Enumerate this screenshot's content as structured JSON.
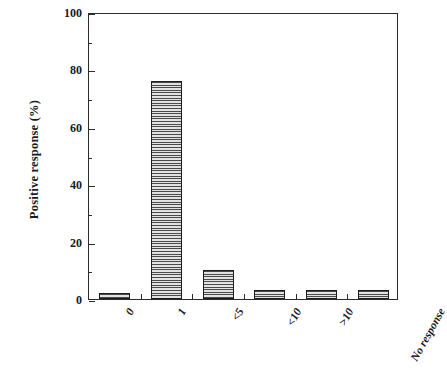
{
  "chart_data": {
    "type": "bar",
    "title": "",
    "subtitle": "",
    "xlabel": "",
    "ylabel": "Positive response (%)",
    "categories": [
      "0",
      "1",
      "<5",
      "<10",
      ">10",
      "No response"
    ],
    "values": [
      2,
      76,
      10,
      3,
      3,
      3
    ],
    "series": [
      {
        "name": "Positive response",
        "values": [
          2,
          76,
          10,
          3,
          3,
          3
        ]
      }
    ],
    "ylim": [
      0,
      100
    ],
    "y_major_ticks": [
      0,
      20,
      40,
      60,
      80,
      100
    ],
    "y_minor_ticks": [
      10,
      30,
      50,
      70,
      90
    ],
    "y_tick_labels": [
      "0",
      "20",
      "40",
      "60",
      "80",
      "100"
    ],
    "grid": false,
    "legend": null,
    "legend_position": "none",
    "bar_fill": "horizontal-line-hatch",
    "bar_edge_color": "#1d1d1d",
    "bar_fill_color": "#b4b4b4",
    "axis_color": "#2b2b2b",
    "background_color": "#ffffff",
    "x_tick_label_rotation_deg": -61,
    "annotations": []
  },
  "figure": {
    "scan_artifact": "",
    "frame": {
      "plot_left_px": 88,
      "plot_top_px": 13,
      "plot_width_px": 310,
      "plot_height_px": 287
    }
  }
}
